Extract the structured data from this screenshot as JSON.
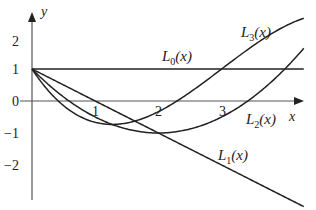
{
  "chart_data": {
    "type": "line",
    "title": "",
    "xlabel": "x",
    "ylabel": "y",
    "xlim": [
      0,
      4.3
    ],
    "ylim": [
      -3,
      2.7
    ],
    "x_ticks": [
      "1",
      "2",
      "3"
    ],
    "y_ticks": [
      "2",
      "1",
      "0",
      "-1",
      "-2"
    ],
    "grid": false,
    "legend": "inline labels",
    "series": [
      {
        "name": "L0(x)",
        "label_main": "L",
        "label_sub": "0",
        "label_arg": "(x)",
        "formula": "1",
        "x": [
          0,
          1,
          2,
          3,
          4.3
        ],
        "y": [
          1,
          1,
          1,
          1,
          1
        ]
      },
      {
        "name": "L1(x)",
        "label_main": "L",
        "label_sub": "1",
        "label_arg": "(x)",
        "formula": "1 - x",
        "x": [
          0,
          1,
          2,
          3,
          4.3
        ],
        "y": [
          1,
          0,
          -1,
          -2,
          -3.3
        ]
      },
      {
        "name": "L2(x)",
        "label_main": "L",
        "label_sub": "2",
        "label_arg": "(x)",
        "formula": "(x^2 - 4x + 2)/2",
        "x": [
          0,
          1,
          2,
          3,
          4.3
        ],
        "y": [
          1,
          -0.5,
          -1,
          -0.5,
          1
        ]
      },
      {
        "name": "L3(x)",
        "label_main": "L",
        "label_sub": "3",
        "label_arg": "(x)",
        "formula": "(-x^3 + 9x^2 - 18x + 6)/6",
        "x": [
          0,
          1,
          2,
          3,
          4.3
        ],
        "y": [
          1,
          -0.67,
          -0.33,
          1,
          2.2
        ]
      }
    ]
  },
  "axis": {
    "x_label": "x",
    "y_label": "y",
    "origin_label": "0"
  }
}
